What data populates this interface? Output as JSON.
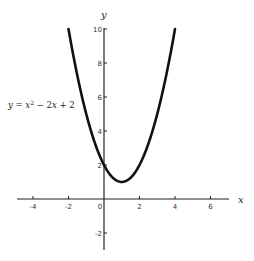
{
  "chart_data": {
    "type": "line",
    "title": "",
    "equation_label": {
      "lhs": "y",
      "x_var": "x",
      "exp": "2",
      "rest": " − 2",
      "x2_var": "x",
      "tail": " + 2",
      "full": "y = x^2 − 2x + 2"
    },
    "xlabel": "x",
    "ylabel": "y",
    "xlim": [
      -5,
      7
    ],
    "ylim": [
      -3,
      10
    ],
    "x_ticks": [
      -4,
      -2,
      0,
      2,
      4,
      6
    ],
    "x_tick_labels": [
      "-4",
      "-2",
      "0",
      "2",
      "4",
      "6"
    ],
    "y_ticks": [
      -2,
      2,
      4,
      6,
      8,
      10
    ],
    "y_tick_labels": [
      "-2",
      "2",
      "4",
      "6",
      "8",
      "10"
    ],
    "grid": false,
    "legend": "none",
    "series": [
      {
        "name": "y = x^2 - 2x + 2",
        "function": "x^2 - 2x + 2",
        "x_range": [
          -2,
          4
        ],
        "x": [
          -2,
          -1.5,
          -1,
          -0.5,
          0,
          0.5,
          1,
          1.5,
          2,
          2.5,
          3,
          3.5,
          4
        ],
        "values": [
          10,
          7.25,
          5,
          3.25,
          2,
          1.25,
          1,
          1.25,
          2,
          3.25,
          5,
          7.25,
          10
        ],
        "color": "#111111"
      }
    ]
  }
}
